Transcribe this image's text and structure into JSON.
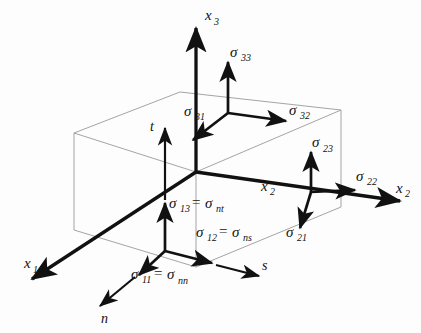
{
  "figure": {
    "background_color": "#fdfdfd",
    "ink_color": "#111111",
    "wireframe_color": "#9a9a9a"
  },
  "axes": [
    {
      "name": "x1",
      "base": "x",
      "sub": "1",
      "direction": "down-left"
    },
    {
      "name": "x2",
      "base": "x",
      "sub": "2",
      "direction": "right"
    },
    {
      "name": "x3",
      "base": "x",
      "sub": "3",
      "direction": "up"
    }
  ],
  "local_vectors": [
    {
      "name": "n",
      "label": "n",
      "direction": "down-left",
      "meaning": "normal"
    },
    {
      "name": "s",
      "label": "s",
      "direction": "right",
      "meaning": "in-plane-1"
    },
    {
      "name": "t",
      "label": "t",
      "direction": "up",
      "meaning": "in-plane-2"
    }
  ],
  "faces": {
    "top": {
      "name": "x3-face",
      "components": [
        {
          "base": "σ",
          "sub": "33",
          "direction": "up"
        },
        {
          "base": "σ",
          "sub": "32",
          "direction": "right"
        },
        {
          "base": "σ",
          "sub": "31",
          "direction": "down-left"
        }
      ]
    },
    "right": {
      "name": "x2-face",
      "components": [
        {
          "base": "σ",
          "sub": "23",
          "direction": "up"
        },
        {
          "base": "σ",
          "sub": "22",
          "direction": "right"
        },
        {
          "base": "σ",
          "sub": "21",
          "direction": "down-left"
        }
      ]
    },
    "front": {
      "name": "x1-face",
      "components": [
        {
          "base": "σ",
          "sub": "13",
          "direction": "up",
          "equals_base": "σ",
          "equals_sub": "nt"
        },
        {
          "base": "σ",
          "sub": "12",
          "direction": "right",
          "equals_base": "σ",
          "equals_sub": "ns"
        },
        {
          "base": "σ",
          "sub": "11",
          "direction": "down-left",
          "equals_base": "σ",
          "equals_sub": "nn"
        }
      ]
    }
  },
  "labels": {
    "sigma": "σ",
    "equals": "=",
    "x": "x",
    "n": "n",
    "s": "s",
    "t": "t",
    "sub_33": "33",
    "sub_32": "32",
    "sub_31": "31",
    "sub_23": "23",
    "sub_22": "22",
    "sub_21": "21",
    "sub_13": "13",
    "sub_12": "12",
    "sub_11": "11",
    "sub_nt": "nt",
    "sub_ns": "ns",
    "sub_nn": "nn",
    "sub_1": "1",
    "sub_2": "2",
    "sub_3": "3"
  }
}
